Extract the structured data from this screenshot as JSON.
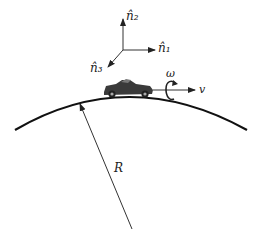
{
  "diagram": {
    "labels": {
      "n2": "n̂₂",
      "n1": "n̂₁",
      "n3": "n̂₃",
      "omega": "ω",
      "v": "v",
      "R": "R"
    },
    "elements": [
      "coordinate-axes",
      "car",
      "road-arc",
      "radius-arrow",
      "angular-velocity-loop",
      "velocity-arrow"
    ]
  }
}
